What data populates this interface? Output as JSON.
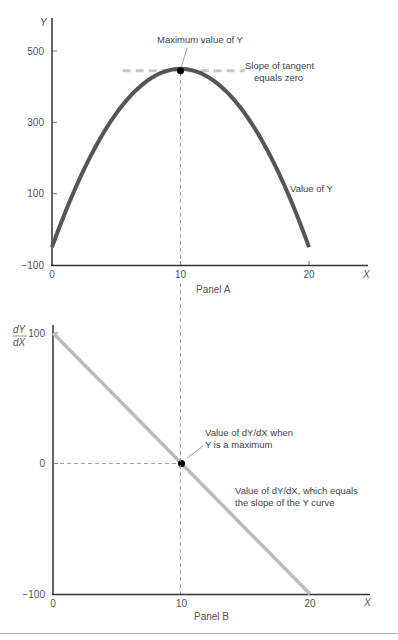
{
  "chart_data": [
    {
      "type": "line",
      "panel_label": "Panel A",
      "xlabel": "X",
      "ylabel": "Y",
      "xlim": [
        0,
        22
      ],
      "ylim": [
        -100,
        560
      ],
      "x_ticks": [
        0,
        10,
        20
      ],
      "x_tick_labels": [
        "0",
        "10",
        "20"
      ],
      "y_ticks": [
        -100,
        100,
        300,
        500
      ],
      "y_tick_labels": [
        "−100",
        "100",
        "300",
        "500"
      ],
      "grid": false,
      "series": [
        {
          "name": "Value of Y",
          "formula": "Y = 450 - 5(X-10)^2",
          "x": [
            0,
            1,
            2,
            3,
            4,
            5,
            6,
            7,
            8,
            9,
            10,
            11,
            12,
            13,
            14,
            15,
            16,
            17,
            18,
            19,
            20
          ],
          "y": [
            -50,
            45,
            130,
            205,
            270,
            325,
            370,
            405,
            430,
            445,
            450,
            445,
            430,
            405,
            370,
            325,
            270,
            205,
            130,
            45,
            -50
          ],
          "color": "#555555"
        }
      ],
      "max_point": {
        "x": 10,
        "y": 450
      },
      "tangent_y": 450,
      "tangent_x_range": [
        5.5,
        15
      ],
      "annotations": {
        "max_label": "Maximum value of Y",
        "tangent_label_line1": "Slope of tangent",
        "tangent_label_line2": "equals zero",
        "curve_label": "Value of Y"
      }
    },
    {
      "type": "line",
      "panel_label": "Panel B",
      "xlabel": "X",
      "ylabel_num": "dY",
      "ylabel_den": "dX",
      "xlim": [
        0,
        22
      ],
      "ylim": [
        -100,
        110
      ],
      "x_ticks": [
        0,
        10,
        20
      ],
      "x_tick_labels": [
        "0",
        "10",
        "20"
      ],
      "y_ticks": [
        -100,
        0,
        100
      ],
      "y_tick_labels": [
        "−100",
        "0",
        "100"
      ],
      "grid": false,
      "series": [
        {
          "name": "Value of dY/dX",
          "formula": "dY/dX = 100 - 10X",
          "x": [
            0,
            20
          ],
          "y": [
            100,
            -100
          ],
          "color": "#bbbbbb"
        }
      ],
      "zero_point": {
        "x": 10,
        "y": 0
      },
      "annotations": {
        "zero_label_line1": "Value of dY/dX when",
        "zero_label_line2": "Y  is a maximum",
        "line_label_line1": "Value of dY/dX, which equals",
        "line_label_line2": "the slope of the Y curve"
      }
    }
  ]
}
